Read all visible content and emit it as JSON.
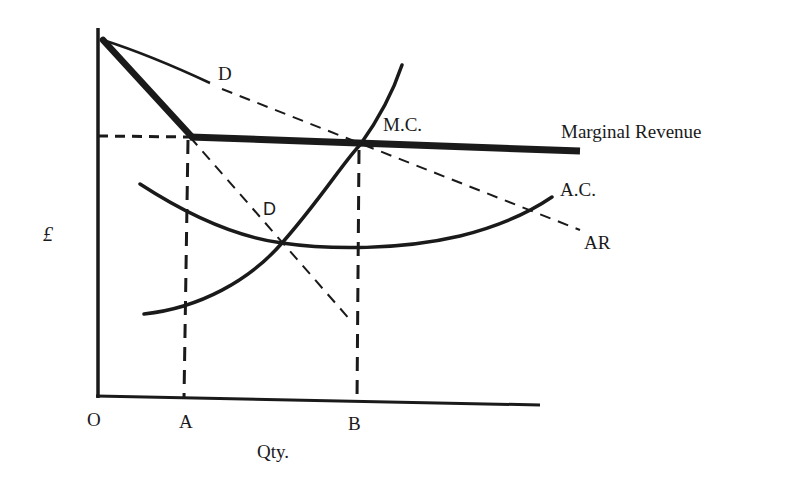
{
  "diagram": {
    "type": "kinked demand curve (oligopoly) cost and revenue diagram",
    "axes": {
      "y_label": "£",
      "x_label": "Qty.",
      "origin_label": "O",
      "x_ticks": [
        "A",
        "B"
      ]
    },
    "curves": {
      "demand_upper_label": "D",
      "demand_lower_label": "D",
      "marginal_revenue_label": "Marginal Revenue",
      "marginal_cost_label": "M.C.",
      "average_cost_label": "A.C.",
      "average_revenue_label": "AR"
    },
    "colors": {
      "ink": "#1a1a1a",
      "background": "#ffffff"
    }
  }
}
